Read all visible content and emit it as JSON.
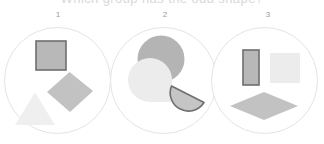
{
  "figure": {
    "cropped_heading_text": "Which group has the odd shape?",
    "background_color": "#ffffff",
    "circle_outline_color": "#e4e4e6",
    "label_color": "#9a9a9e"
  },
  "palette": {
    "medium_gray_fill": "#b4b4b4",
    "light_gray_fill": "#c9c9c9",
    "pale_gray_fill": "#ececec",
    "very_pale_gray_fill": "#efefef",
    "outline_dark": "#6e6e6e"
  },
  "panels": [
    {
      "label": "1",
      "shapes": [
        {
          "name": "outlined-square",
          "kind": "square",
          "fill": "#b8b8b8",
          "stroke": "#6e6e6e",
          "outlined": true
        },
        {
          "name": "rotated-square-diamond",
          "kind": "square-rotated",
          "fill": "#c2c2c2",
          "stroke": "none",
          "outlined": false
        },
        {
          "name": "triangle",
          "kind": "triangle",
          "fill": "#efefef",
          "stroke": "none",
          "outlined": false
        }
      ]
    },
    {
      "label": "2",
      "shapes": [
        {
          "name": "filled-circle",
          "kind": "circle",
          "fill": "#b4b4b4",
          "stroke": "none",
          "outlined": false
        },
        {
          "name": "pie-with-wedge-removed",
          "kind": "pac-man",
          "fill": "#ececec",
          "stroke": "none",
          "outlined": false
        },
        {
          "name": "outlined-half-disc",
          "kind": "semicircle",
          "fill": "#c5c5c5",
          "stroke": "#6e6e6e",
          "outlined": true
        }
      ]
    },
    {
      "label": "3",
      "shapes": [
        {
          "name": "outlined-vertical-rectangle",
          "kind": "rectangle",
          "fill": "#b8b8b8",
          "stroke": "#6e6e6e",
          "outlined": true
        },
        {
          "name": "pale-square",
          "kind": "square",
          "fill": "#ececec",
          "stroke": "none",
          "outlined": false
        },
        {
          "name": "flat-rhombus",
          "kind": "rhombus",
          "fill": "#c2c2c2",
          "stroke": "none",
          "outlined": false
        }
      ]
    }
  ]
}
